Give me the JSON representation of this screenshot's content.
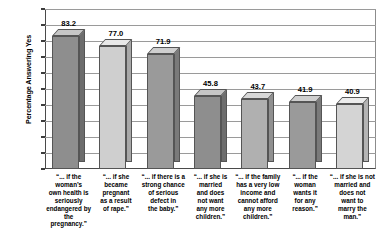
{
  "chart_data": {
    "type": "bar",
    "title": "",
    "xlabel": "",
    "ylabel": "Percentage Answering Yes",
    "ylim": [
      0,
      100
    ],
    "ytick_labels": [
      "100",
      "90",
      "80",
      "70",
      "60",
      "50",
      "40",
      "30",
      "20",
      "10",
      "0"
    ],
    "ytick_values": [
      100,
      90,
      80,
      70,
      60,
      50,
      40,
      30,
      20,
      10,
      0
    ],
    "grid": true,
    "legend": "none",
    "categories": [
      "“... if the woman’s own health is seriously endangered by the pregnancy.”",
      "“... if she became pregnant as a result of rape.”",
      "“... if there is a strong chance of serious defect in the baby.”",
      "“... if she is married and does not want any more children.”",
      "“... if the family has a very low income and cannot afford any more children.”",
      "“... if the woman wants it for any reason.”",
      "“... if she is not married and does not want to marry the man.”"
    ],
    "category_lines": [
      [
        "“... if the",
        "woman’s",
        "own health is",
        "seriously",
        "endangered by",
        "the pregnancy.”"
      ],
      [
        "“... if she",
        "became",
        "pregnant",
        "as a result",
        "of rape.”"
      ],
      [
        "“... if there is a",
        "strong chance",
        "of serious",
        "defect in",
        "the baby.”"
      ],
      [
        "“... if she is",
        "married",
        "and does",
        "not want",
        "any more",
        "children.”"
      ],
      [
        "“... if the family",
        "has a very low",
        "income and",
        "cannot afford",
        "any more",
        "children.”"
      ],
      [
        "“... if the",
        "woman",
        "wants it",
        "for any",
        "reason.”"
      ],
      [
        "“... if she is not",
        "married and",
        "does not",
        "want to",
        "marry the",
        "man.”"
      ]
    ],
    "values": [
      83.2,
      77.0,
      71.9,
      45.8,
      43.7,
      41.9,
      40.9
    ],
    "value_labels": [
      "83.2",
      "77.0",
      "71.9",
      "45.8",
      "43.7",
      "41.9",
      "40.9"
    ],
    "bar_colors": [
      "#8e8e8e",
      "#cfcfcf",
      "#9a9a9a",
      "#8e8e8e",
      "#b0b0b0",
      "#9a9a9a",
      "#d4d4d4"
    ],
    "bar_top_colors": [
      "#c6c6c6",
      "#e8e8e8",
      "#cfcfcf",
      "#c6c6c6",
      "#d8d8d8",
      "#cfcfcf",
      "#ececec"
    ],
    "bar_side_colors": [
      "#6d6d6d",
      "#a8a8a8",
      "#7a7a7a",
      "#6d6d6d",
      "#909090",
      "#7a7a7a",
      "#b4b4b4"
    ],
    "axis_color": "#4a4a4a",
    "grid_color": "#9a9a9a",
    "background": "#ffffff"
  }
}
